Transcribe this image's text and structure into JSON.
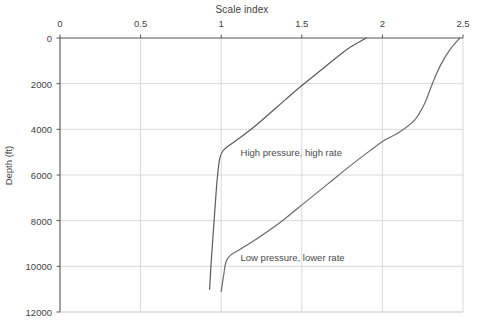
{
  "chart_data": {
    "type": "line",
    "title": "Scale index",
    "xlabel": "Scale index",
    "ylabel": "Depth (ft)",
    "xlim": [
      0,
      2.5
    ],
    "ylim": [
      12000,
      0
    ],
    "y_inverted": true,
    "grid": true,
    "legend_position": "inline-annotation",
    "xticks": [
      "0",
      "0.5",
      "1",
      "1.5",
      "2",
      "2.5"
    ],
    "xtick_values": [
      0,
      0.5,
      1,
      1.5,
      2,
      2.5
    ],
    "yticks": [
      "0",
      "2000",
      "4000",
      "6000",
      "8000",
      "10000",
      "12000"
    ],
    "ytick_values": [
      0,
      2000,
      4000,
      6000,
      8000,
      10000,
      12000
    ],
    "series": [
      {
        "name": "High pressure, high rate",
        "color": "#5a5a5a",
        "points": [
          [
            1.9,
            0
          ],
          [
            1.78,
            500
          ],
          [
            1.62,
            1400
          ],
          [
            1.48,
            2200
          ],
          [
            1.35,
            3000
          ],
          [
            1.22,
            3800
          ],
          [
            1.12,
            4350
          ],
          [
            1.05,
            4700
          ],
          [
            1.01,
            4950
          ],
          [
            0.99,
            5300
          ],
          [
            0.975,
            6200
          ],
          [
            0.962,
            7400
          ],
          [
            0.95,
            8600
          ],
          [
            0.938,
            9800
          ],
          [
            0.928,
            11000
          ]
        ]
      },
      {
        "name": "Low pressure, lower rate",
        "color": "#6a6a6a",
        "points": [
          [
            2.48,
            0
          ],
          [
            2.42,
            500
          ],
          [
            2.36,
            1200
          ],
          [
            2.31,
            2000
          ],
          [
            2.26,
            2900
          ],
          [
            2.2,
            3600
          ],
          [
            2.1,
            4150
          ],
          [
            2.02,
            4450
          ],
          [
            1.93,
            4900
          ],
          [
            1.8,
            5600
          ],
          [
            1.66,
            6400
          ],
          [
            1.52,
            7200
          ],
          [
            1.38,
            8000
          ],
          [
            1.24,
            8700
          ],
          [
            1.13,
            9200
          ],
          [
            1.06,
            9500
          ],
          [
            1.03,
            9800
          ],
          [
            1.015,
            10400
          ],
          [
            1.0,
            11100
          ]
        ]
      }
    ],
    "annotations": [
      {
        "text": "High pressure, high rate",
        "x": 1.12,
        "y": 5050
      },
      {
        "text": "Low pressure, lower rate",
        "x": 1.12,
        "y": 9650
      }
    ]
  },
  "colors": {
    "axis": "#555555",
    "grid": "#d9d9d9",
    "text": "#3f3f3f",
    "background": "#ffffff"
  }
}
